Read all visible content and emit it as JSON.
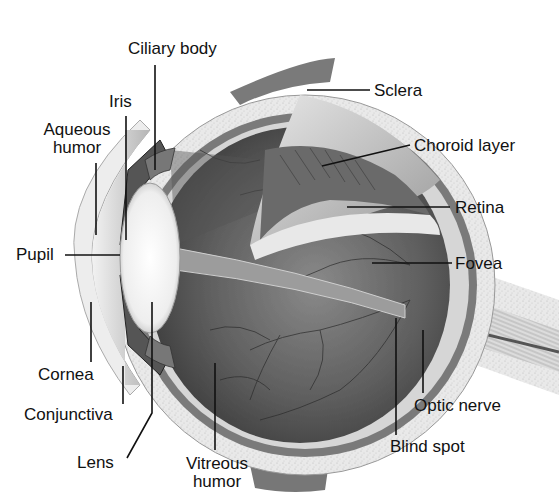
{
  "diagram": {
    "labels": {
      "ciliary_body": "Ciliary body",
      "iris": "Iris",
      "aqueous_humor_1": "Aqueous",
      "aqueous_humor_2": "humor",
      "pupil": "Pupil",
      "cornea": "Cornea",
      "conjunctiva": "Conjunctiva",
      "lens": "Lens",
      "vitreous_humor_1": "Vitreous",
      "vitreous_humor_2": "humor",
      "sclera": "Sclera",
      "choroid_layer": "Choroid layer",
      "retina": "Retina",
      "fovea": "Fovea",
      "optic_nerve": "Optic nerve",
      "blind_spot": "Blind spot"
    },
    "colors": {
      "background": "#ffffff",
      "sclera": "#e6e6e6",
      "choroid": "#6e6e6e",
      "retina": "#d9d9d9",
      "vitreous": "#5a5a5a",
      "lens": "#f4f4f4",
      "cornea": "#ececec",
      "leader_line": "#111111"
    }
  }
}
